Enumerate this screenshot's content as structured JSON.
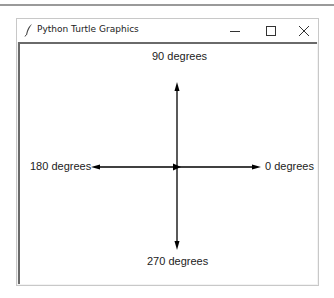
{
  "window": {
    "title": "Python Turtle Graphics",
    "icon": "feather-icon",
    "controls": {
      "minimize": "minimize-icon",
      "maximize": "maximize-icon",
      "close": "close-icon"
    }
  },
  "canvas": {
    "labels": {
      "up": "90 degrees",
      "left": "180 degrees",
      "right": "0 degrees",
      "down": "270 degrees"
    },
    "line_color": "#000000"
  }
}
